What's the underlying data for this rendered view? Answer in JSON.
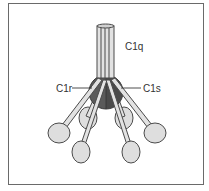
{
  "diagram": {
    "labels": {
      "c1q": "C1q",
      "c1r": "C1r",
      "c1s": "C1s"
    },
    "colors": {
      "stalk": "#e2e2e2",
      "head": "#dedede",
      "c1r_c1s": "#5a5a5a",
      "c1r_c1s_dark": "#444444",
      "outline": "#4a4a4a",
      "frame": "#6a6a6a"
    },
    "heads_count": 6
  }
}
